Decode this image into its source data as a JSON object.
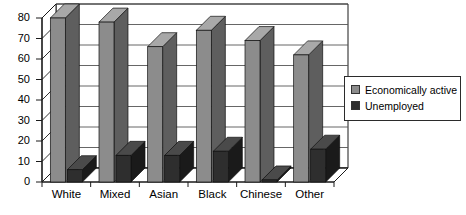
{
  "chart_data": {
    "type": "bar",
    "title": "",
    "subtitle": "",
    "xlabel": "",
    "ylabel": "",
    "ylim": [
      0,
      80
    ],
    "ytick_values": [
      0,
      10,
      20,
      30,
      40,
      50,
      60,
      70,
      80
    ],
    "ytick_labels": [
      "0",
      "10",
      "20",
      "30",
      "40",
      "50",
      "60",
      "70",
      "80"
    ],
    "grid": true,
    "grid_axis": "y",
    "legend_position": "right",
    "style": "3d-grouped-bar",
    "categories": [
      "White",
      "Mixed",
      "Asian",
      "Black",
      "Chinese",
      "Other"
    ],
    "series": [
      {
        "name": "Economically active",
        "color": "#8c8c8c",
        "values": [
          80,
          78,
          66,
          74,
          69,
          62
        ]
      },
      {
        "name": "Unemployed",
        "color": "#2e2e2e",
        "values": [
          6,
          13,
          13,
          15,
          1,
          16
        ]
      }
    ]
  },
  "legend": {
    "items": [
      {
        "label": "Economically active",
        "color": "#8c8c8c"
      },
      {
        "label": "Unemployed",
        "color": "#2e2e2e"
      }
    ]
  },
  "axes": {
    "y": {
      "ticks": [
        "80",
        "70",
        "60",
        "50",
        "40",
        "30",
        "20",
        "10",
        "0"
      ]
    },
    "x": {
      "ticks": [
        "White",
        "Mixed",
        "Asian",
        "Black",
        "Chinese",
        "Other"
      ]
    }
  },
  "colors": {
    "series_active": "#8c8c8c",
    "series_active_top": "#a8a8a8",
    "series_active_side": "#5e5e5e",
    "series_unemployed": "#2e2e2e",
    "series_unemployed_top": "#4a4a4a",
    "series_unemployed_side": "#1a1a1a",
    "axis": "#1a1a1a",
    "grid": "#555555",
    "wall": "#ffffff",
    "background": "#ffffff"
  }
}
